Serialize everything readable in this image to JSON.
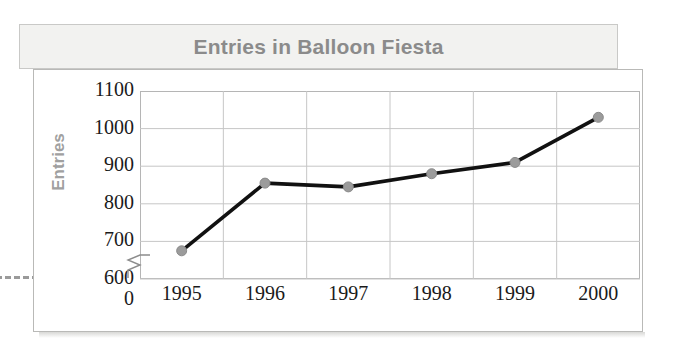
{
  "chart_data": {
    "type": "line",
    "title": "Entries in Balloon Fiesta",
    "xlabel": "",
    "ylabel": "Entries",
    "categories": [
      "1995",
      "1996",
      "1997",
      "1998",
      "1999",
      "2000"
    ],
    "values": [
      675,
      855,
      845,
      880,
      910,
      1030
    ],
    "series": [
      {
        "name": "Entries",
        "values": [
          675,
          855,
          845,
          880,
          910,
          1030
        ]
      }
    ],
    "ylim": [
      600,
      1100
    ],
    "y_ticks": [
      "1100",
      "1000",
      "900",
      "800",
      "700",
      "600",
      "0"
    ],
    "y_tick_values": [
      1100,
      1000,
      900,
      800,
      700,
      600,
      0
    ],
    "axis_break": true,
    "axis_break_between": [
      0,
      600
    ],
    "grid": true,
    "legend": "none",
    "line_color": "#111111",
    "marker_color": "#9b9b9b",
    "grid_color": "#c6c6c6"
  },
  "title_banner": {
    "text": "Entries in Balloon Fiesta",
    "text_color": "#8b8b8b",
    "background": "#f2f2f0"
  },
  "axis": {
    "y_title": "Entries",
    "y_title_color": "#a0a0a0",
    "tick_label_color": "#1a1a1a"
  },
  "page": {
    "background": "#ffffff",
    "card_border_color": "#b9b9b7",
    "rule_color": "#9a9a9a"
  }
}
